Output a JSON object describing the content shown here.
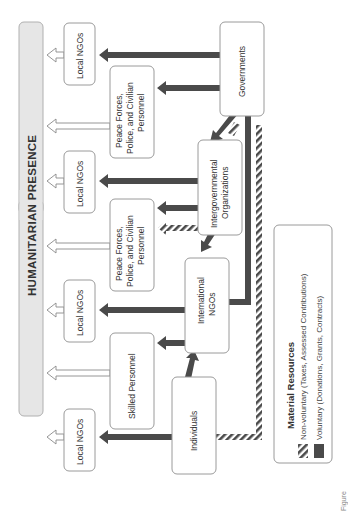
{
  "banner": {
    "title": "HUMANITARIAN PRESENCE"
  },
  "nodes": {
    "local_ngos_1": "Local NGOs",
    "peace_forces_1": [
      "Peace Forces,",
      "Police, and Civilian",
      "Personnel"
    ],
    "local_ngos_2": "Local NGOs",
    "peace_forces_2": [
      "Peace Forces,",
      "Police, and Civilian",
      "Personnel"
    ],
    "local_ngos_3": "Local NGOs",
    "skilled_personnel": "Skilled Personnel",
    "local_ngos_4": "Local NGOs",
    "governments": "Governments",
    "intergovernmental": [
      "Intergovernmental",
      "Organizations"
    ],
    "international_ngos": [
      "International",
      "NGOs"
    ],
    "individuals": "Individuals"
  },
  "legend": {
    "title": "Material Resources",
    "items": [
      {
        "pattern": "hatched",
        "label": "Non-voluntary (Taxes, Assessed Contributions)"
      },
      {
        "pattern": "solid",
        "label": "Voluntary (Donations, Grants, Contracts)"
      }
    ]
  },
  "colors": {
    "arrow_dark": "#4a4a4a",
    "banner_fill": "#e6e6e6",
    "box_stroke": "#9a9a9a"
  },
  "caption": "Figure"
}
